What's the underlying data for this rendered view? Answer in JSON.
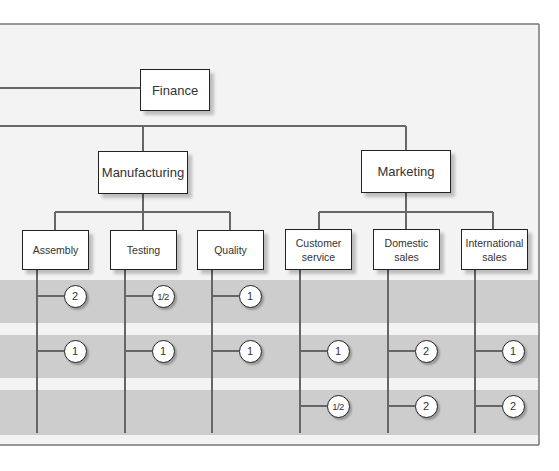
{
  "diagram": {
    "type": "organization-chart",
    "colors": {
      "frame_background": "#f2f2f2",
      "band": "#cccccc",
      "line": "#666666",
      "box_border": "#222222"
    },
    "top": {
      "label": "Finance"
    },
    "divisions": [
      {
        "label": "Manufacturing",
        "departments": [
          {
            "label": "Assembly",
            "values": [
              "2",
              "1"
            ]
          },
          {
            "label": "Testing",
            "values": [
              "1/2",
              "1"
            ]
          },
          {
            "label": "Quality",
            "values": [
              "1",
              "1"
            ]
          }
        ]
      },
      {
        "label": "Marketing",
        "departments": [
          {
            "label": "Customer service",
            "values": [
              "",
              "1",
              "1/2"
            ]
          },
          {
            "label": "Domestic sales",
            "values": [
              "",
              "2",
              "2"
            ]
          },
          {
            "label": "International sales",
            "values": [
              "",
              "1",
              "2"
            ]
          }
        ]
      }
    ]
  }
}
